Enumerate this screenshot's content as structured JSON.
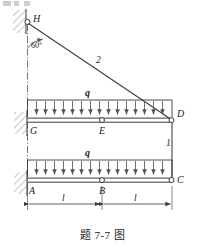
{
  "figure": {
    "caption": "题 7-7 图",
    "labels": {
      "H": "H",
      "angle": "60°",
      "member2": "2",
      "member1": "1",
      "q_upper": "q",
      "q_lower": "q",
      "D": "D",
      "G": "G",
      "E": "E",
      "A": "A",
      "B": "B",
      "C": "C",
      "dim_left": "l",
      "dim_right": "l"
    },
    "colors": {
      "line": "#3a3a3a",
      "load_arrow": "#555555",
      "hatch": "#666666",
      "text": "#222222",
      "background": "#ffffff"
    },
    "geometry": {
      "pin_H": [
        27,
        22
      ],
      "joint_D": [
        172,
        120
      ],
      "joint_C": [
        172,
        180
      ],
      "hinge_E": [
        102,
        120
      ],
      "hinge_B": [
        102,
        180
      ],
      "wall_x": 27,
      "upper_beam_y": 120,
      "lower_beam_y": 180,
      "load_height": 20,
      "arrow_count_upper": 16,
      "arrow_count_lower": 16,
      "angle_degrees": 60
    }
  }
}
